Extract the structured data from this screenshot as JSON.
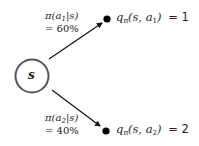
{
  "diagram": {
    "type": "policy-backup-tree",
    "state_node": {
      "label": "s",
      "stroke_color": "#555555"
    },
    "branches": [
      {
        "policy_prefix": "π(a",
        "policy_sub": "1",
        "policy_suffix": "|s)",
        "probability": "= 60%",
        "q_prefix": "q",
        "q_pi_sub": "π",
        "q_args_prefix": "(s, a",
        "q_action_sub": "1",
        "q_args_suffix": ")",
        "q_value": "= 1"
      },
      {
        "policy_prefix": "π(a",
        "policy_sub": "2",
        "policy_suffix": "|s)",
        "probability": "= 40%",
        "q_prefix": "q",
        "q_pi_sub": "π",
        "q_args_prefix": "(s, a",
        "q_action_sub": "2",
        "q_args_suffix": ")",
        "q_value": "= 2"
      }
    ],
    "colors": {
      "text": "#222222",
      "arrow": "#111111",
      "action_dot": "#000000",
      "state_circle": "#555555"
    }
  }
}
